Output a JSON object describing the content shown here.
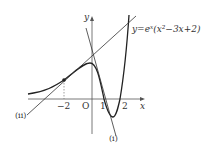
{
  "labels": {
    "y_axis": "y",
    "x_axis": "x",
    "origin": "O",
    "tick_neg2": "−2",
    "tick_1": "1",
    "tick_2": "2",
    "equation": "y=eˣ(x²−3x+2)",
    "line_i": "(i)",
    "line_ii": "(ii)"
  },
  "colors": {
    "stroke": "#333333",
    "background": "#ffffff"
  }
}
